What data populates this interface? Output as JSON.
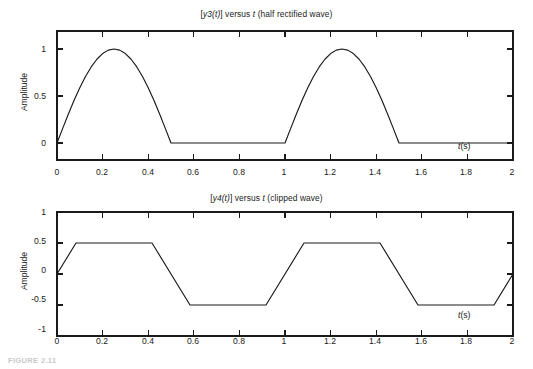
{
  "figure": {
    "caption": "FIGURE 2.11"
  },
  "panels": [
    {
      "id": "top",
      "title_prefix": "[",
      "title_expr": "y3(t)",
      "title_mid": "] versus ",
      "title_var": "t",
      "title_suffix": " (half rectified wave)",
      "title_full": "[y3(t)] versus t (half rectified wave)",
      "ylabel": "Amplitude",
      "xlabel_var": "t",
      "xlabel_unit": "(s)",
      "xlabel_full": "t(s)",
      "yticks": [
        "0",
        "0.5",
        "1"
      ],
      "xticks": [
        "0",
        "0.2",
        "0.4",
        "0.6",
        "0.8",
        "1",
        "1.2",
        "1.4",
        "1.6",
        "1.8",
        "2"
      ]
    },
    {
      "id": "bottom",
      "title_prefix": "[",
      "title_expr": "y4(t)",
      "title_mid": "] versus ",
      "title_var": "t",
      "title_suffix": " (clipped wave)",
      "title_full": "[y4(t)] versus t (clipped wave)",
      "ylabel": "Amplitude",
      "xlabel_var": "t",
      "xlabel_unit": "(s)",
      "xlabel_full": "t(s)",
      "yticks": [
        "-1",
        "-0.5",
        "0",
        "0.5",
        "1"
      ],
      "xticks": [
        "0",
        "0.2",
        "0.4",
        "0.6",
        "0.8",
        "1",
        "1.2",
        "1.4",
        "1.6",
        "1.8",
        "2"
      ]
    }
  ],
  "chart_data": [
    {
      "type": "line",
      "title": "[y3(t)] versus t (half rectified wave)",
      "xlabel": "t(s)",
      "ylabel": "Amplitude",
      "xlim": [
        0,
        2
      ],
      "ylim": [
        -0.12,
        1.22
      ],
      "xticks": [
        0,
        0.2,
        0.4,
        0.6,
        0.8,
        1,
        1.2,
        1.4,
        1.6,
        1.8,
        2
      ],
      "yticks": [
        0,
        0.5,
        1
      ],
      "grid": false,
      "legend": null,
      "series": [
        {
          "name": "y3(t) half rectified sine",
          "formula": "y3(t) = max(sin(2*pi*t), 0)",
          "period": 1.0,
          "amplitude": 1.0,
          "x": [
            0,
            0.025,
            0.05,
            0.075,
            0.1,
            0.125,
            0.15,
            0.175,
            0.2,
            0.225,
            0.25,
            0.275,
            0.3,
            0.325,
            0.35,
            0.375,
            0.4,
            0.425,
            0.45,
            0.475,
            0.5,
            0.55,
            0.6,
            0.65,
            0.7,
            0.75,
            0.8,
            0.85,
            0.9,
            0.95,
            1.0,
            1.025,
            1.05,
            1.075,
            1.1,
            1.125,
            1.15,
            1.175,
            1.2,
            1.225,
            1.25,
            1.275,
            1.3,
            1.325,
            1.35,
            1.375,
            1.4,
            1.425,
            1.45,
            1.475,
            1.5,
            1.55,
            1.6,
            1.65,
            1.7,
            1.75,
            1.8,
            1.85,
            1.9,
            1.95,
            2.0
          ],
          "y": [
            0,
            0.156,
            0.309,
            0.454,
            0.588,
            0.707,
            0.809,
            0.891,
            0.951,
            0.988,
            1.0,
            0.988,
            0.951,
            0.891,
            0.809,
            0.707,
            0.588,
            0.454,
            0.309,
            0.156,
            0,
            0,
            0,
            0,
            0,
            0,
            0,
            0,
            0,
            0,
            0,
            0.156,
            0.309,
            0.454,
            0.588,
            0.707,
            0.809,
            0.891,
            0.951,
            0.988,
            1.0,
            0.988,
            0.951,
            0.891,
            0.809,
            0.707,
            0.588,
            0.454,
            0.309,
            0.156,
            0,
            0,
            0,
            0,
            0,
            0,
            0,
            0,
            0,
            0,
            0
          ]
        }
      ]
    },
    {
      "type": "line",
      "title": "[y4(t)] versus t (clipped wave)",
      "xlabel": "t(s)",
      "ylabel": "Amplitude",
      "xlim": [
        0,
        2
      ],
      "ylim": [
        -1.0,
        1.0
      ],
      "xticks": [
        0,
        0.2,
        0.4,
        0.6,
        0.8,
        1,
        1.2,
        1.4,
        1.6,
        1.8,
        2
      ],
      "yticks": [
        -1,
        -0.5,
        0,
        0.5,
        1
      ],
      "grid": false,
      "legend": null,
      "series": [
        {
          "name": "y4(t) clipped sine",
          "formula": "y4(t) = clip(sin(2*pi*t), -0.5, 0.5)",
          "period": 1.0,
          "clip_level": 0.5,
          "x": [
            0,
            0.0833,
            0.4167,
            0.5833,
            0.9167,
            1.0833,
            1.4167,
            1.5833,
            1.9167,
            2.0
          ],
          "y": [
            0,
            0.5,
            0.5,
            -0.5,
            -0.5,
            0.5,
            0.5,
            -0.5,
            -0.5,
            0.0
          ]
        }
      ]
    }
  ],
  "style": {
    "line_color": "#1a1a1a",
    "axis_color": "#1a1a1a",
    "background": "#ffffff"
  }
}
